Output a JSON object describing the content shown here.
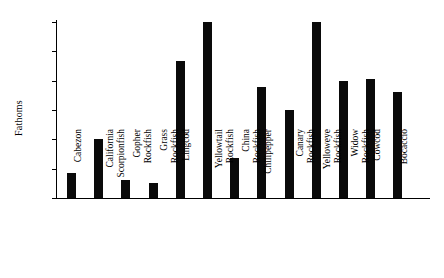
{
  "chart_data": {
    "type": "bar",
    "title": "",
    "subtitle": "",
    "xlabel": "",
    "ylabel": "Fathoms",
    "ylim": [
      0,
      300
    ],
    "yticks": [
      0,
      50,
      100,
      150,
      200,
      250,
      300
    ],
    "ytick_labels": [
      "0",
      "50",
      "100",
      "150",
      "200",
      "250",
      "300"
    ],
    "grid": false,
    "legend": null,
    "bar_color": "#0a0a0a",
    "categories": [
      "Cabezon",
      "California Scorpionfish",
      "Gopher Rockfish",
      "Grass Rockfish",
      "Lingcod",
      "Yellowtail Rockfish",
      "China Rockfish",
      "Chilipepper",
      "Canary Rockfish",
      "Yelloweye Rockfish",
      "Widow Rockfish",
      "Cowcod",
      "Bocaccio"
    ],
    "category_lines": [
      [
        "Cabezon",
        ""
      ],
      [
        "California",
        "Scorpionfish"
      ],
      [
        "Gopher",
        "Rockfish"
      ],
      [
        "Grass",
        "Rockfish"
      ],
      [
        "Lingcod",
        ""
      ],
      [
        "Yellowtail",
        "Rockfish"
      ],
      [
        "China",
        "Rockfish"
      ],
      [
        "Chilipepper",
        ""
      ],
      [
        "Canary",
        "Rockfish"
      ],
      [
        "Yelloweye",
        "Rockfish"
      ],
      [
        "Widow",
        "Rockfish"
      ],
      [
        "Cowcod",
        ""
      ],
      [
        "Bocaccio",
        ""
      ]
    ],
    "values": [
      43,
      100,
      30,
      25,
      233,
      300,
      68,
      190,
      150,
      300,
      200,
      202,
      180
    ]
  }
}
